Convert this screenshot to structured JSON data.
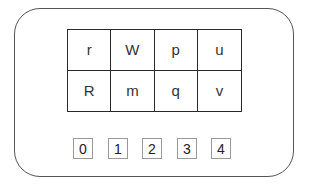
{
  "grid": {
    "rows": [
      [
        "r",
        "W",
        "p",
        "u"
      ],
      [
        "R",
        "m",
        "q",
        "v"
      ]
    ]
  },
  "indices": [
    "0",
    "1",
    "2",
    "3",
    "4"
  ],
  "colors": {
    "frame_border": "#555555",
    "grid_border": "#2a2a2a",
    "index_border": "#9a9a9a",
    "background": "#ffffff"
  }
}
